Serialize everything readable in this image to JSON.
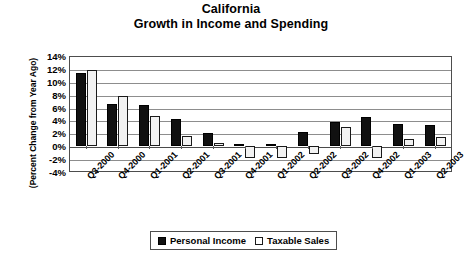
{
  "chart": {
    "title_line1": "California",
    "title_line2": "Growth in Income and Spending",
    "ylabel": "(Percent Change from Year Ago)"
  },
  "legend": {
    "position": "bottom",
    "items": [
      {
        "label": "Personal Income",
        "swatch": "black-filled-square",
        "color": "#111111"
      },
      {
        "label": "Taxable Sales",
        "swatch": "white-outlined-square",
        "color": "#ffffff"
      }
    ]
  },
  "yaxis": {
    "ticks": [
      "14%",
      "12%",
      "10%",
      "8%",
      "6%",
      "4%",
      "2%",
      "0%",
      "-2%",
      "-4%"
    ],
    "min": -4,
    "max": 14,
    "step": 2
  },
  "chart_data": {
    "type": "bar",
    "title": "California Growth in Income and Spending",
    "xlabel": "",
    "ylabel": "(Percent Change from Year Ago)",
    "ylim": [
      -4,
      14
    ],
    "ytick_step": 2,
    "grid": true,
    "legend_position": "bottom",
    "categories": [
      "Q3-2000",
      "Q4-2000",
      "Q1-2001",
      "Q2-2001",
      "Q3-2001",
      "Q4-2001",
      "Q1-2002",
      "Q2-2002",
      "Q3-2002",
      "Q4-2002",
      "Q1-2003",
      "Q2-2003"
    ],
    "series": [
      {
        "name": "Personal Income",
        "color": "#111111",
        "values": [
          11.5,
          6.6,
          6.4,
          4.2,
          2.0,
          0.3,
          0.3,
          2.2,
          3.8,
          4.5,
          3.5,
          3.2
        ]
      },
      {
        "name": "Taxable Sales",
        "color": "#ffffff",
        "values": [
          12.0,
          7.9,
          4.7,
          1.6,
          0.5,
          -2.0,
          -2.0,
          -1.3,
          3.0,
          -2.0,
          1.0,
          1.4
        ]
      }
    ]
  }
}
